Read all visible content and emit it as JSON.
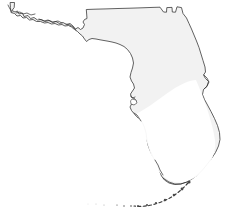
{
  "figure": {
    "title": "Florida",
    "type": "outline-map",
    "background_color": "#ffffff",
    "land_fill_color": "#f2f2f2",
    "outline_color": "#3a3a3a",
    "interior_highlight_color": "#ffffff",
    "width_px": 233,
    "height_px": 223,
    "labels_visible": false
  },
  "map_data": {
    "type": "outline-map",
    "regions": [
      {
        "name": "florida-mainland",
        "label": "",
        "fill": "#f2f2f2",
        "stroke": "#3a3a3a",
        "path": "M 11 3 L 14 3 L 14 8 L 12 11 L 16 14 L 19 13 L 21 16 L 25 15 L 28 18 L 32 17 L 36 20 L 41 20 L 45 22 L 49 21 L 53 23 L 57 22 L 60 24 L 63 23 L 66 25 L 69 24 L 72 26 L 74 29 L 78 31 L 80 34 L 83 36 L 85 39 L 86 35 L 88 33 L 86 31 L 85 28 L 86 25 L 83 23 L 84 20 L 87 19 L 86 10 L 92 10 L 100 9 L 110 9 L 122 8 L 134 8 L 146 7 L 157 7 L 163 12 L 167 12 L 167 8 L 172 8 L 172 12 L 176 12 L 177 7 L 181 8 L 182 13 L 186 17 L 188 22 L 191 27 L 194 33 L 196 39 L 199 45 L 201 51 L 203 57 L 205 63 L 206 70 L 204 74 L 206 78 L 209 82 L 207 87 L 203 90 L 202 95 L 204 100 L 207 105 L 211 111 L 215 118 L 218 125 L 220 132 L 221 139 L 220 146 L 217 152 L 213 158 L 209 164 L 205 170 L 200 175 L 195 179 L 190 183 L 184 185 L 178 186 L 172 185 L 167 182 L 163 178 L 161 173 L 159 168 L 156 163 L 153 158 L 150 152 L 148 146 L 147 140 L 146 134 L 145 128 L 143 123 L 140 119 L 137 116 L 134 113 L 132 110 L 130 107 L 131 104 L 134 104 L 136 101 L 134 98 L 131 97 L 130 94 L 132 91 L 134 88 L 133 84 L 131 81 L 130 77 L 131 73 L 133 69 L 134 64 L 133 59 L 131 54 L 128 50 L 124 47 L 120 45 L 116 43 L 112 42 L 108 41 L 104 40 L 100 39 L 96 38 L 92 38 L 89 40 L 86 41 L 85 39 L 83 36 L 80 34 L 78 31 L 74 29 L 72 26 L 69 24 L 66 25 L 63 23 L 60 24 L 57 22 L 53 23 L 49 21 L 45 22 L 41 20 L 36 20 L 32 17 L 28 18 L 25 15 L 21 16 L 19 13 L 16 14 L 12 11 L 14 8 L 14 3 Z"
      },
      {
        "name": "florida-keys",
        "label": "",
        "stroke": "#3a3a3a",
        "style": "dashed-arc",
        "path": "M 186 185 L 181 191 L 175 196 L 168 200 L 160 203 L 152 205 L 145 206 L 139 206 L 134 205"
      }
    ],
    "features": [
      {
        "name": "panhandle",
        "approx_px": [
          11,
          3,
          90,
          42
        ]
      },
      {
        "name": "big-bend",
        "approx_px": [
          85,
          30,
          135,
          70
        ]
      },
      {
        "name": "tampa-bay",
        "approx_px": [
          128,
          95,
          145,
          125
        ]
      },
      {
        "name": "cape-canaveral",
        "approx_px": [
          200,
          75,
          212,
          92
        ]
      },
      {
        "name": "southern-tip",
        "approx_px": [
          160,
          170,
          200,
          190
        ]
      },
      {
        "name": "florida-keys-arc",
        "approx_px": [
          134,
          183,
          190,
          208
        ]
      }
    ]
  }
}
